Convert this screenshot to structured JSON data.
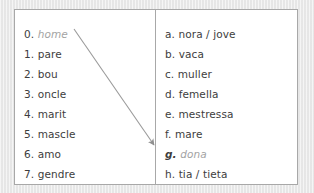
{
  "exercise": {
    "left_column": {
      "name": "numbered-terms",
      "items": [
        {
          "marker": "0.",
          "term": "home",
          "style": "example"
        },
        {
          "marker": "1.",
          "term": "pare",
          "style": "normal"
        },
        {
          "marker": "2.",
          "term": "bou",
          "style": "normal"
        },
        {
          "marker": "3.",
          "term": "oncle",
          "style": "normal"
        },
        {
          "marker": "4.",
          "term": "marit",
          "style": "normal"
        },
        {
          "marker": "5.",
          "term": "mascle",
          "style": "normal"
        },
        {
          "marker": "6.",
          "term": "amo",
          "style": "normal"
        },
        {
          "marker": "7.",
          "term": "gendre",
          "style": "normal"
        }
      ]
    },
    "right_column": {
      "name": "lettered-terms",
      "items": [
        {
          "marker": "a.",
          "term": "nora / jove",
          "style": "normal"
        },
        {
          "marker": "b.",
          "term": "vaca",
          "style": "normal"
        },
        {
          "marker": "c.",
          "term": "muller",
          "style": "normal"
        },
        {
          "marker": "d.",
          "term": "femella",
          "style": "normal"
        },
        {
          "marker": "e.",
          "term": "mestressa",
          "style": "normal"
        },
        {
          "marker": "f.",
          "term": "mare",
          "style": "normal"
        },
        {
          "marker": "g.",
          "term": "dona",
          "style": "example-target"
        },
        {
          "marker": "h.",
          "term": "tia / tieta",
          "style": "normal"
        }
      ]
    },
    "connections": [
      {
        "from": "0. home",
        "to": "g. dona",
        "kind": "arrow"
      }
    ],
    "colors": {
      "page_background": "#e9e9e9",
      "card_background": "#ffffff",
      "border": "#a8a8a8",
      "text": "#3d3d3d",
      "example_text": "#a3a3a3",
      "arrow": "#9a9a9a"
    }
  }
}
